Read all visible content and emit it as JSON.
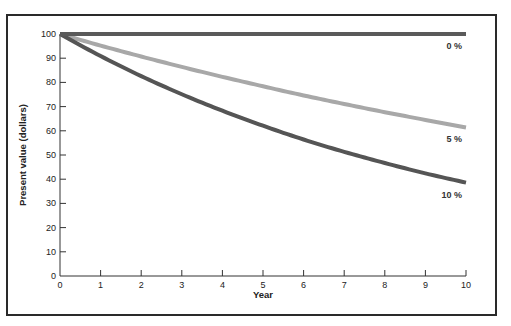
{
  "chart_data": {
    "type": "line",
    "title": "",
    "xlabel": "Year",
    "ylabel": "Present value (dollars)",
    "xlim": [
      0,
      10
    ],
    "ylim": [
      0,
      100
    ],
    "x_ticks": [
      0,
      1,
      2,
      3,
      4,
      5,
      6,
      7,
      8,
      9,
      10
    ],
    "y_ticks": [
      0,
      10,
      20,
      30,
      40,
      50,
      60,
      70,
      80,
      90,
      100
    ],
    "grid": false,
    "legend": "inline labels at right end of each line",
    "x": [
      0,
      1,
      2,
      3,
      4,
      5,
      6,
      7,
      8,
      9,
      10
    ],
    "series": [
      {
        "name": "0 %",
        "color": "#5a5a5a",
        "values": [
          100,
          100,
          100,
          100,
          100,
          100,
          100,
          100,
          100,
          100,
          100
        ]
      },
      {
        "name": "5 %",
        "color": "#a8a8a8",
        "values": [
          100,
          95.2,
          90.7,
          86.4,
          82.3,
          78.4,
          74.6,
          71.1,
          67.7,
          64.5,
          61.4
        ]
      },
      {
        "name": "10 %",
        "color": "#555555",
        "values": [
          100,
          90.9,
          82.6,
          75.1,
          68.3,
          62.1,
          56.4,
          51.3,
          46.7,
          42.4,
          38.6
        ]
      }
    ]
  }
}
